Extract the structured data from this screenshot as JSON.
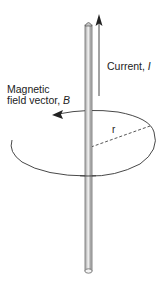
{
  "diagram": {
    "labels": {
      "current_text": "Current,",
      "current_symbol": "I",
      "field_line1": "Magnetic",
      "field_line2_text": "field vector,",
      "field_symbol": "B",
      "radius_symbol": "r"
    },
    "elements": {
      "wire": "vertical cylindrical conductor",
      "current_arrow": "upward arrow parallel to wire",
      "field_loop": "elliptical loop around wire with arrow pointing counter-clockwise (viewed from above)",
      "radius_line": "dashed line from wire to loop"
    },
    "colors": {
      "line": "#333333",
      "wire_fill": "#bdbdbd",
      "wire_highlight": "#e6e6e6",
      "background": "#ffffff"
    }
  }
}
